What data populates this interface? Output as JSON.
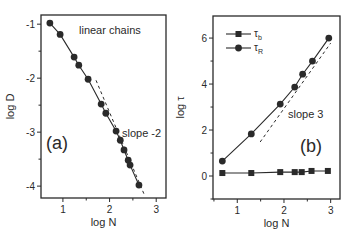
{
  "chart_data": [
    {
      "type": "line",
      "panel_label": "(a)",
      "title": "",
      "annotation_top": "linear chains",
      "annotation_slope": "slope -2",
      "xlabel": "log N",
      "ylabel": "log D",
      "xlim": [
        0.53,
        3.21
      ],
      "ylim": [
        -4.22,
        -0.83
      ],
      "xticks": [
        1,
        2,
        3
      ],
      "yticks": [
        -1,
        -2,
        -3,
        -4
      ],
      "grid": false,
      "series": [
        {
          "name": "linear chains",
          "marker": "circle",
          "x": [
            0.72,
            0.94,
            1.24,
            1.34,
            1.54,
            1.82,
            1.92,
            2.14,
            2.23,
            2.31,
            2.4,
            2.44,
            2.63
          ],
          "y": [
            -0.98,
            -1.19,
            -1.61,
            -1.76,
            -2.02,
            -2.48,
            -2.65,
            -2.98,
            -3.15,
            -3.33,
            -3.52,
            -3.61,
            -3.98
          ]
        }
      ],
      "reference_line": {
        "label": "slope -2",
        "style": "dashed",
        "x": [
          1.71,
          2.76
        ],
        "y": [
          -2.04,
          -4.19
        ]
      }
    },
    {
      "type": "line",
      "panel_label": "(b)",
      "title": "",
      "annotation_slope": "slope 3",
      "xlabel": "log N",
      "ylabel": "log τ",
      "xlim": [
        0.48,
        3.2
      ],
      "ylim": [
        -1.0,
        6.96
      ],
      "xticks": [
        1,
        2,
        3
      ],
      "yticks": [
        0,
        2,
        4,
        6
      ],
      "grid": false,
      "legend_position": "upper left",
      "series": [
        {
          "name": "τb",
          "legend_main": "τ",
          "legend_sub": "b",
          "marker": "square",
          "x": [
            0.68,
            1.3,
            1.92,
            2.23,
            2.38,
            2.59,
            2.94
          ],
          "y": [
            0.13,
            0.13,
            0.17,
            0.17,
            0.17,
            0.22,
            0.22
          ]
        },
        {
          "name": "τR",
          "legend_main": "τ",
          "legend_sub": "R",
          "marker": "circle",
          "x": [
            0.68,
            1.3,
            1.92,
            2.23,
            2.4,
            2.61,
            2.96
          ],
          "y": [
            0.65,
            1.83,
            3.13,
            3.87,
            4.43,
            5.0,
            6.0
          ]
        }
      ],
      "reference_line": {
        "label": "slope 3",
        "style": "dashed",
        "x": [
          1.49,
          3.0
        ],
        "y": [
          1.48,
          5.78
        ]
      }
    }
  ]
}
